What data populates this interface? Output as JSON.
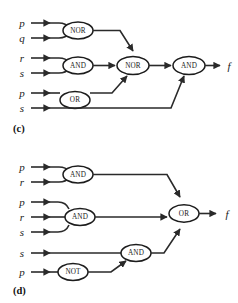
{
  "figure": {
    "background_color": "#ffffff",
    "line_color": "#2a2a2a",
    "panels": [
      {
        "id": "c",
        "label": "(c)",
        "output_label": "f",
        "inputs": [
          "p",
          "q",
          "r",
          "s",
          "p",
          "s"
        ],
        "gates": [
          {
            "id": "c-nor-1",
            "type": "NOR",
            "label": "NOR",
            "inputs": [
              "p",
              "q"
            ]
          },
          {
            "id": "c-and-1",
            "type": "AND",
            "label": "AND",
            "inputs": [
              "r",
              "s"
            ]
          },
          {
            "id": "c-or-1",
            "type": "OR",
            "label": "OR",
            "inputs": [
              "p"
            ]
          },
          {
            "id": "c-nor-2",
            "type": "NOR",
            "label": "NOR",
            "inputs": [
              "c-nor-1",
              "c-and-1",
              "c-or-1"
            ]
          },
          {
            "id": "c-and-2",
            "type": "AND",
            "label": "AND",
            "inputs": [
              "c-nor-2",
              "s"
            ]
          }
        ]
      },
      {
        "id": "d",
        "label": "(d)",
        "output_label": "f",
        "inputs": [
          "p",
          "r",
          "p",
          "r",
          "s",
          "s",
          "p"
        ],
        "gates": [
          {
            "id": "d-and-1",
            "type": "AND",
            "label": "AND",
            "inputs": [
              "p",
              "r"
            ]
          },
          {
            "id": "d-and-2",
            "type": "AND",
            "label": "AND",
            "inputs": [
              "p",
              "r",
              "s"
            ]
          },
          {
            "id": "d-not-1",
            "type": "NOT",
            "label": "NOT",
            "inputs": [
              "p"
            ]
          },
          {
            "id": "d-and-3",
            "type": "AND",
            "label": "AND",
            "inputs": [
              "s",
              "d-not-1"
            ]
          },
          {
            "id": "d-or-1",
            "type": "OR",
            "label": "OR",
            "inputs": [
              "d-and-1",
              "d-and-2",
              "d-and-3"
            ]
          }
        ]
      }
    ]
  }
}
